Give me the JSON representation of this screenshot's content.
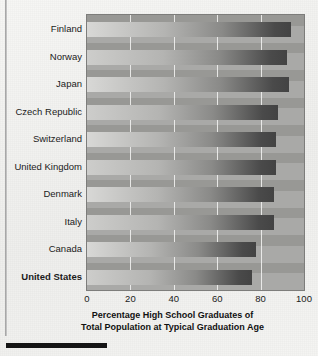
{
  "chart_data": {
    "type": "bar",
    "orientation": "horizontal",
    "title": "",
    "xlabel": "Percentage High School Graduates of Total Population at Typical Graduation Age",
    "ylabel": "",
    "xlim": [
      0,
      100
    ],
    "xticks": [
      0,
      20,
      40,
      60,
      80,
      100
    ],
    "grid": true,
    "legend": false,
    "highlight_category": "United States",
    "categories": [
      "Finland",
      "Norway",
      "Japan",
      "Czech Republic",
      "Switzerland",
      "United Kingdom",
      "Denmark",
      "Italy",
      "Canada",
      "United States"
    ],
    "values": [
      94,
      92,
      93,
      88,
      87,
      87,
      86,
      86,
      78,
      76
    ],
    "axis_title_line1": "Percentage High School Graduates of",
    "axis_title_line2": "Total Population at Typical Graduation Age"
  },
  "colors": {
    "plot_background": "#a9a9a7",
    "page_background": "#f3f3f1",
    "gridline": "#f5f5f3",
    "bar_dark": "#4a4a4a",
    "bar_mid": "#6e6e6e",
    "text": "#1b1b1b"
  },
  "axis": {
    "tick_labels": [
      "0",
      "20",
      "40",
      "60",
      "80",
      "100"
    ]
  }
}
